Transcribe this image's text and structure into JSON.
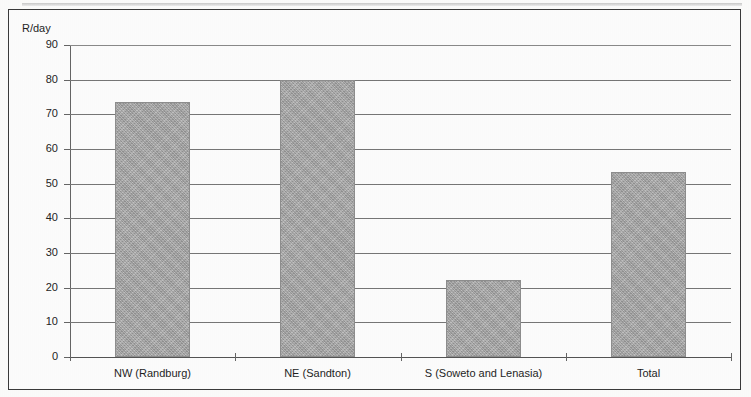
{
  "chart_data": {
    "type": "bar",
    "title": "",
    "subtitle": "",
    "xlabel": "",
    "ylabel": "R/day",
    "categories": [
      "NW (Randburg)",
      "NE (Sandton)",
      "S (Soweto and Lenasia)",
      "Total"
    ],
    "values": [
      73.7,
      79.8,
      22.3,
      53.3
    ],
    "ylim": [
      0,
      90
    ],
    "ytick_step": 10,
    "ytick_labels": [
      "90",
      "80",
      "70",
      "60",
      "50",
      "40",
      "30",
      "20",
      "10",
      "0"
    ],
    "ytick_values": [
      90,
      80,
      70,
      60,
      50,
      40,
      30,
      20,
      10,
      0
    ],
    "grid": true,
    "grid_axis": "y",
    "legend": false,
    "legend_position": "none",
    "series": [
      {
        "name": "R/day",
        "values": [
          73.7,
          79.8,
          22.3,
          53.3
        ]
      }
    ],
    "colors": {
      "bar_fill": "#a9a9a9",
      "bar_border": "#8e8e8e",
      "gridline": "#777777",
      "axis": "#555555",
      "text": "#1f1f1f",
      "frame": "#3a3a3a",
      "background": "#fdfdfd"
    }
  }
}
